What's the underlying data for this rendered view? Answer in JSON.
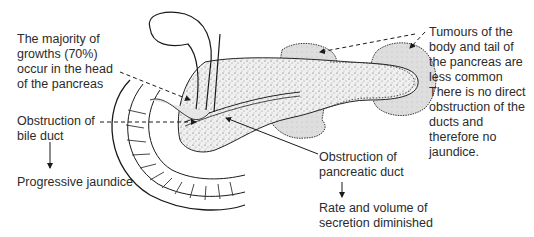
{
  "diagram": {
    "labels": {
      "majority_growths": "The majority of\ngrowths (70%)\noccur in the head\nof the pancreas",
      "bile_duct_obstruction": "Obstruction of\nbile duct",
      "progressive_jaundice": "Progressive jaundice",
      "tumours_body_tail": "Tumours of the\nbody and tail of\nthe pancreas are\nless common\nThere is no direct\nobstruction of the\nducts and\ntherefore no\njaundice.",
      "pancreatic_duct_obstruction": "Obstruction of\npancreatic duct",
      "secretion_diminished": "Rate and volume of\nsecretion diminished"
    },
    "structures": [
      "gallbladder",
      "bile-duct",
      "duodenum",
      "pancreas-head",
      "pancreas-body",
      "pancreas-tail",
      "tumour-body",
      "tumour-tail"
    ],
    "colors": {
      "line": "#1a1a1a",
      "tumour_fill": "#dcdcdc",
      "pancreas_fill": "#eeeeee",
      "text": "#2b2b2b"
    }
  }
}
